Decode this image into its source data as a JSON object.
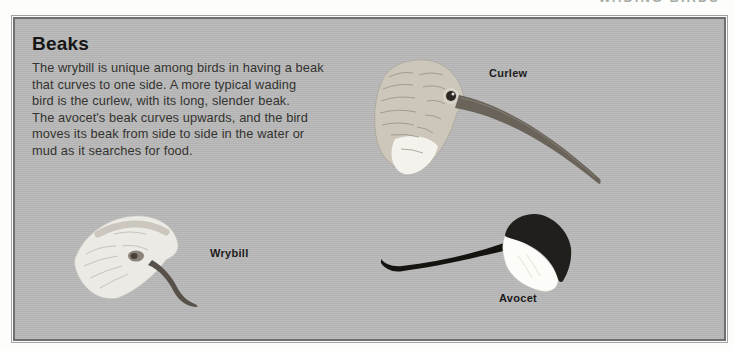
{
  "page": {
    "running_header": "WADING BIRDS"
  },
  "panel": {
    "title": "Beaks",
    "paragraph_lines": [
      "The wrybill is unique among birds in having a beak",
      "that curves to one side. A more typical wading",
      "bird is the curlew, with its long, slender beak.",
      "The avocet's beak curves upwards, and the bird",
      "moves its beak from side to side in the water or",
      "mud as it searches for food."
    ]
  },
  "figures": {
    "curlew": {
      "label": "Curlew"
    },
    "wrybill": {
      "label": "Wrybill"
    },
    "avocet": {
      "label": "Avocet"
    }
  },
  "colors": {
    "page_background": "#fdfdfc",
    "panel_background": "#b9b9b9",
    "panel_border": "#6f6f6f",
    "title_text": "#161616",
    "body_text": "#333330",
    "running_header_text": "#a7aea7",
    "curlew_plumage": "#ccc6bb",
    "curlew_beak": "#6a635a",
    "wrybill_plumage": "#eceae4",
    "avocet_cap": "#211f1c",
    "avocet_face": "#fcfcf9"
  }
}
